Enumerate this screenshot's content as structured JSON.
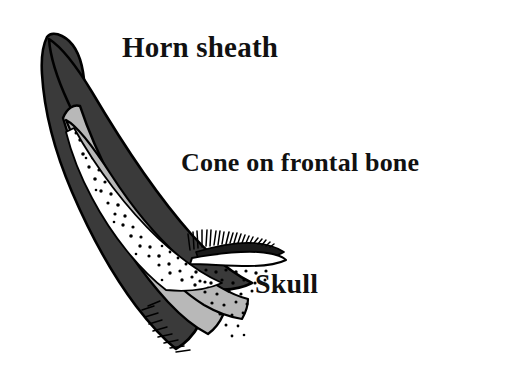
{
  "figure": {
    "background_color": "#ffffff",
    "width": 519,
    "height": 376
  },
  "labels": {
    "horn_sheath": "Horn sheath",
    "cone_on_frontal_bone": "Cone on frontal bone",
    "skull": "Skull"
  },
  "colors": {
    "outline": "#000000",
    "sheath_fill": "#3a3a3a",
    "cone_fill": "#b8b8b8",
    "core_fill": "#ffffff",
    "stipple": "#000000",
    "background": "#ffffff",
    "text": "#111111"
  },
  "structures": [
    {
      "name": "horn-sheath",
      "description": "dark charcoal keratin sheath forming the outer curved horn",
      "fill": "#3a3a3a"
    },
    {
      "name": "cone-on-frontal-bone",
      "description": "light gray bony cone layer beneath the sheath",
      "fill": "#b8b8b8"
    },
    {
      "name": "horn-core-cavity",
      "description": "white stippled interior cavity of the bony core",
      "fill": "#ffffff"
    },
    {
      "name": "skull",
      "description": "hatched skull surface band extending to the right from the horn base",
      "fill": "#000000"
    }
  ]
}
